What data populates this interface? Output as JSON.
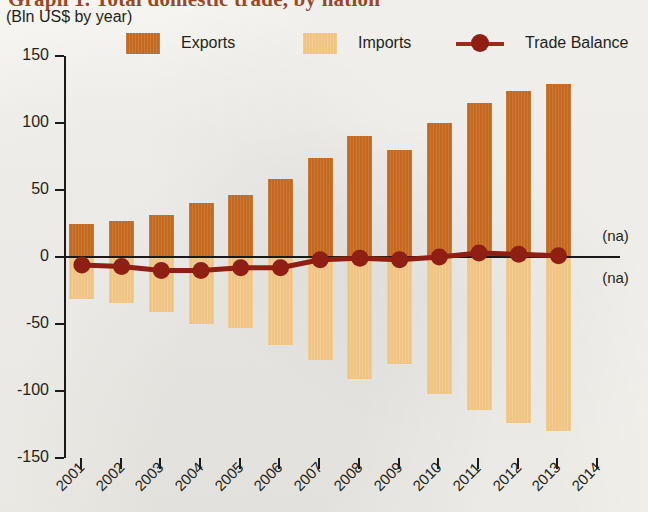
{
  "header": {
    "title": "Graph 1. Total domestic trade, by nation",
    "subtitle": "(Bln US$ by year)"
  },
  "legend": {
    "position": "top",
    "items": [
      {
        "label": "Exports",
        "color": "#c4691f",
        "marker": "square",
        "name": "legend-swatch-exports"
      },
      {
        "label": "Imports",
        "color": "#f0c483",
        "marker": "square",
        "name": "legend-swatch-imports"
      },
      {
        "label": "Trade Balance",
        "color": "#8e1f12",
        "marker": "line-dot",
        "name": "legend-marker-trade-balance"
      }
    ]
  },
  "annotations": {
    "na_upper": "(na)",
    "na_lower": "(na)"
  },
  "chart_data": {
    "type": "bar",
    "title": "Graph 1. Total domestic trade, by nation",
    "subtitle": "(Bln US$ by year)",
    "xlabel": "",
    "ylabel": "Bln US$",
    "ylim": [
      -150,
      150
    ],
    "yticks": [
      150,
      100,
      50,
      0,
      -50,
      -100,
      -150
    ],
    "ytick_labels": [
      "150",
      "100",
      "50",
      "0",
      "-50",
      "-100",
      "-150"
    ],
    "grid": false,
    "categories": [
      "2001",
      "2002",
      "2003",
      "2004",
      "2005",
      "2006",
      "2007",
      "2008",
      "2009",
      "2010",
      "2011",
      "2012",
      "2013"
    ],
    "xtick_labels": [
      "2001",
      "2002",
      "2003",
      "2004",
      "2005",
      "2006",
      "2007",
      "2008",
      "2009",
      "2010",
      "2011",
      "2012",
      "2013",
      "2014"
    ],
    "series": [
      {
        "name": "Exports",
        "type": "bar",
        "color": "#c4691f",
        "values": [
          25,
          27,
          31,
          40,
          46,
          58,
          74,
          90,
          80,
          100,
          115,
          124,
          129
        ]
      },
      {
        "name": "Imports",
        "type": "bar",
        "color": "#f0c483",
        "values": [
          -31,
          -34,
          -41,
          -50,
          -53,
          -66,
          -77,
          -91,
          -80,
          -102,
          -114,
          -124,
          -130
        ]
      },
      {
        "name": "Trade Balance",
        "type": "line",
        "color": "#8e1f12",
        "values": [
          -6,
          -7,
          -10,
          -10,
          -8,
          -8,
          -2,
          -1,
          -2,
          0,
          3,
          2,
          1
        ]
      }
    ]
  }
}
